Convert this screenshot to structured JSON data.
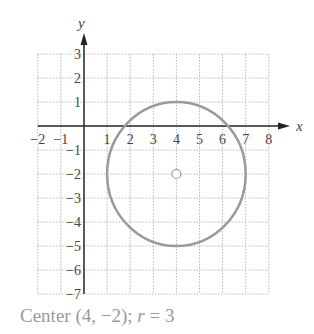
{
  "chart_data": {
    "type": "scatter",
    "title": "",
    "xlabel": "x",
    "ylabel": "y",
    "xlim": [
      -2,
      8
    ],
    "ylim": [
      -7,
      3
    ],
    "grid": true,
    "x_ticks": [
      -2,
      -1,
      1,
      2,
      3,
      4,
      5,
      6,
      7,
      8
    ],
    "y_ticks": [
      3,
      2,
      1,
      -1,
      -2,
      -3,
      -4,
      -5,
      -6,
      -7
    ],
    "shapes": [
      {
        "kind": "circle",
        "center": [
          4,
          -2
        ],
        "radius": 3,
        "color": "#9a9a9a"
      }
    ],
    "points": [
      {
        "x": 4,
        "y": -2,
        "marker": "open-circle",
        "label": "center"
      }
    ],
    "annotations": [
      "Center (4, −2); r = 3"
    ]
  },
  "caption": {
    "prefix": "Center (4, −2); ",
    "r_var": "r",
    "suffix": " = 3"
  },
  "colors": {
    "axis": "#222222",
    "grid": "#b8b8b8",
    "curve": "#9a9a9a",
    "label": "#444444",
    "caption": "#9a9a9a"
  }
}
